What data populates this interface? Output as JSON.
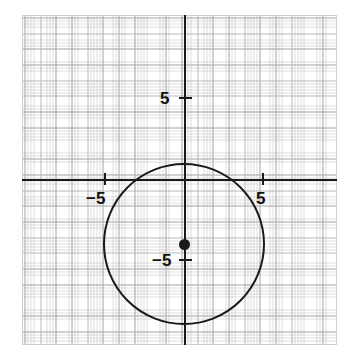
{
  "figure": {
    "width": 356,
    "height": 360,
    "background_color": "#ffffff"
  },
  "axes": {
    "x_axis_name": "x-axis",
    "y_axis_name": "y-axis",
    "axis_color": "#1a1a1a",
    "grid_color": "#b9b9b9",
    "subgrid_color": "#d8d8d8",
    "border_color": "#cfcfcf",
    "origin_label": "",
    "xlim": [
      -10.3,
      9.7
    ],
    "ylim": [
      -10.5,
      10.5
    ],
    "grid": true,
    "minor_grid": true,
    "tick_interval": 5,
    "minor_tick_interval": 1
  },
  "tick_labels": {
    "x_negative": "−5",
    "x_positive": "5",
    "y_positive": "5",
    "y_negative": "−5"
  },
  "chart_data": {
    "type": "scatter",
    "title": "",
    "subtitle": "",
    "xlabel": "",
    "ylabel": "",
    "xlim": [
      -10.3,
      9.7
    ],
    "ylim": [
      -10.5,
      10.5
    ],
    "grid": true,
    "legend": "none",
    "xticks": [
      -5,
      5
    ],
    "xticklabels": [
      "−5",
      "5"
    ],
    "yticks": [
      -5,
      5
    ],
    "yticklabels": [
      "−5",
      "5"
    ],
    "annotations": [],
    "series": [
      {
        "name": "circle",
        "type": "circle",
        "center": [
          0,
          -4
        ],
        "radius": 5.15,
        "stroke_color": "#1a1a1a",
        "stroke_width": 2.4,
        "fill": "none",
        "equation": "x^2 + (y + 4)^2 = 26.5"
      },
      {
        "name": "center-point",
        "type": "scatter",
        "x": [
          0
        ],
        "y": [
          -4
        ],
        "marker": "filled-circle",
        "marker_color": "#1a1a1a",
        "marker_size": 11
      }
    ]
  }
}
